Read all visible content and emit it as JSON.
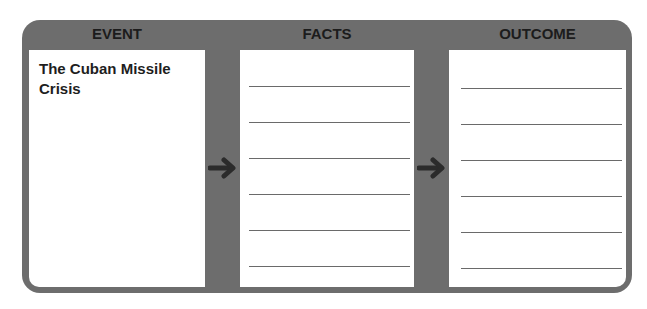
{
  "organizer": {
    "columns": [
      {
        "header": "EVENT"
      },
      {
        "header": "FACTS"
      },
      {
        "header": "OUTCOME"
      }
    ],
    "event": {
      "text": "The Cuban Missile Crisis"
    },
    "facts": {
      "line_count": 6
    },
    "outcome": {
      "line_count": 6
    },
    "arrows": [
      "arrow-right-icon",
      "arrow-right-icon"
    ],
    "colors": {
      "frame": "#6d6d6d",
      "panel": "#ffffff",
      "text": "#1c1c1c",
      "arrow": "#2b2b2b",
      "rule": "#6a6a6a"
    }
  }
}
